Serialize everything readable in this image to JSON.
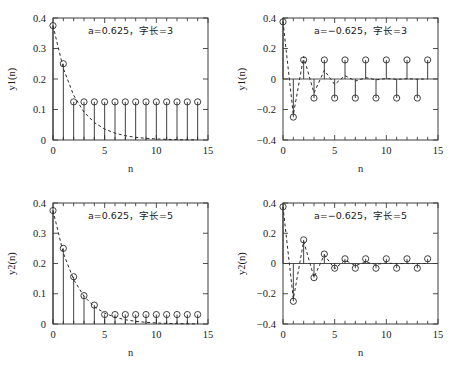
{
  "figure": {
    "width": 460,
    "height": 369,
    "background": "#ffffff",
    "ink_color": "#2a2a2a",
    "axis_color": "#3c3c3c"
  },
  "chart_data": [
    {
      "id": "top-left",
      "type": "scatter",
      "subtype": "stem",
      "title": "",
      "annotation": "a=0.625，字长=3",
      "annotation_parts": {
        "param": "a=0.625",
        "separator": "，",
        "wordlength": "字长=3"
      },
      "xlabel": "n",
      "ylabel": "y1(n)",
      "xlim": [
        0,
        15
      ],
      "ylim": [
        0,
        0.4
      ],
      "xticks": [
        0,
        5,
        10,
        15
      ],
      "xticklabels": [
        "0",
        "5",
        "10",
        "15"
      ],
      "xminor_step": 1,
      "yticks": [
        0,
        0.1,
        0.2,
        0.3,
        0.4
      ],
      "yticklabels": [
        "0",
        "0.1",
        "0.2",
        "0.3",
        "0.4"
      ],
      "grid": false,
      "legend": "none",
      "x": [
        0,
        1,
        2,
        3,
        4,
        5,
        6,
        7,
        8,
        9,
        10,
        11,
        12,
        13,
        14
      ],
      "values": [
        0.375,
        0.25,
        0.125,
        0.125,
        0.125,
        0.125,
        0.125,
        0.125,
        0.125,
        0.125,
        0.125,
        0.125,
        0.125,
        0.125,
        0.125
      ],
      "reference_curve": {
        "name": "ideal",
        "style": "dashed",
        "x": [
          0,
          1,
          2,
          3,
          4,
          5,
          6,
          7,
          8,
          9,
          10,
          11,
          12,
          13,
          14
        ],
        "values": [
          0.375,
          0.2344,
          0.1465,
          0.0916,
          0.0572,
          0.0358,
          0.0224,
          0.014,
          0.0087,
          0.0055,
          0.0034,
          0.0021,
          0.0013,
          0.0008,
          0.0005
        ]
      }
    },
    {
      "id": "top-right",
      "type": "scatter",
      "subtype": "stem",
      "title": "",
      "annotation": "a=−0.625，字长=3",
      "annotation_parts": {
        "param": "a=−0.625",
        "separator": "，",
        "wordlength": "字长=3"
      },
      "xlabel": "n",
      "ylabel": "y1(n)",
      "xlim": [
        0,
        15
      ],
      "ylim": [
        -0.4,
        0.4
      ],
      "xticks": [
        0,
        5,
        10,
        15
      ],
      "xticklabels": [
        "0",
        "5",
        "10",
        "15"
      ],
      "xminor_step": 1,
      "yticks": [
        -0.4,
        -0.2,
        0,
        0.2,
        0.4
      ],
      "yticklabels": [
        "−0.4",
        "−0.2",
        "0",
        "0.2",
        "0.4"
      ],
      "grid": false,
      "legend": "none",
      "x": [
        0,
        1,
        2,
        3,
        4,
        5,
        6,
        7,
        8,
        9,
        10,
        11,
        12,
        13,
        14
      ],
      "values": [
        0.375,
        -0.25,
        0.125,
        -0.125,
        0.125,
        -0.125,
        0.125,
        -0.125,
        0.125,
        -0.125,
        0.125,
        -0.125,
        0.125,
        -0.125,
        0.125
      ],
      "reference_curve": {
        "name": "ideal",
        "style": "dashed",
        "x": [
          0,
          1,
          2,
          3,
          4,
          5,
          6,
          7,
          8,
          9,
          10,
          11,
          12,
          13,
          14
        ],
        "values": [
          0.375,
          -0.2344,
          0.1465,
          -0.0916,
          0.0572,
          -0.0358,
          0.0224,
          -0.014,
          0.0087,
          -0.0055,
          0.0034,
          -0.0021,
          0.0013,
          -0.0008,
          0.0005
        ]
      }
    },
    {
      "id": "bottom-left",
      "type": "scatter",
      "subtype": "stem",
      "title": "",
      "annotation": "a=0.625，字长=5",
      "annotation_parts": {
        "param": "a=0.625",
        "separator": "，",
        "wordlength": "字长=5"
      },
      "xlabel": "n",
      "ylabel": "y2(n)",
      "xlim": [
        0,
        15
      ],
      "ylim": [
        0,
        0.4
      ],
      "xticks": [
        0,
        5,
        10,
        15
      ],
      "xticklabels": [
        "0",
        "5",
        "10",
        "15"
      ],
      "xminor_step": 1,
      "yticks": [
        0,
        0.1,
        0.2,
        0.3,
        0.4
      ],
      "yticklabels": [
        "0",
        "0.1",
        "0.2",
        "0.3",
        "0.4"
      ],
      "grid": false,
      "legend": "none",
      "x": [
        0,
        1,
        2,
        3,
        4,
        5,
        6,
        7,
        8,
        9,
        10,
        11,
        12,
        13,
        14
      ],
      "values": [
        0.375,
        0.25,
        0.15625,
        0.09375,
        0.0625,
        0.03125,
        0.03125,
        0.03125,
        0.03125,
        0.03125,
        0.03125,
        0.03125,
        0.03125,
        0.03125,
        0.03125
      ],
      "reference_curve": {
        "name": "ideal",
        "style": "dashed",
        "x": [
          0,
          1,
          2,
          3,
          4,
          5,
          6,
          7,
          8,
          9,
          10,
          11,
          12,
          13,
          14
        ],
        "values": [
          0.375,
          0.2344,
          0.1465,
          0.0916,
          0.0572,
          0.0358,
          0.0224,
          0.014,
          0.0087,
          0.0055,
          0.0034,
          0.0021,
          0.0013,
          0.0008,
          0.0005
        ]
      }
    },
    {
      "id": "bottom-right",
      "type": "scatter",
      "subtype": "stem",
      "title": "",
      "annotation": "a=−0.625，字长=5",
      "annotation_parts": {
        "param": "a=−0.625",
        "separator": "，",
        "wordlength": "字长=5"
      },
      "xlabel": "n",
      "ylabel": "y2(n)",
      "xlim": [
        0,
        15
      ],
      "ylim": [
        -0.4,
        0.4
      ],
      "xticks": [
        0,
        5,
        10,
        15
      ],
      "xticklabels": [
        "0",
        "5",
        "10",
        "15"
      ],
      "xminor_step": 1,
      "yticks": [
        -0.4,
        -0.2,
        0,
        0.2,
        0.4
      ],
      "yticklabels": [
        "−0.4",
        "−0.2",
        "0",
        "0.2",
        "0.4"
      ],
      "grid": false,
      "legend": "none",
      "x": [
        0,
        1,
        2,
        3,
        4,
        5,
        6,
        7,
        8,
        9,
        10,
        11,
        12,
        13,
        14
      ],
      "values": [
        0.375,
        -0.25,
        0.15625,
        -0.09375,
        0.0625,
        -0.03125,
        0.03125,
        -0.03125,
        0.03125,
        -0.03125,
        0.03125,
        -0.03125,
        0.03125,
        -0.03125,
        0.03125
      ],
      "reference_curve": {
        "name": "ideal",
        "style": "dashed",
        "x": [
          0,
          1,
          2,
          3,
          4,
          5,
          6,
          7,
          8,
          9,
          10,
          11,
          12,
          13,
          14
        ],
        "values": [
          0.375,
          -0.2344,
          0.1465,
          -0.0916,
          0.0572,
          -0.0358,
          0.0224,
          -0.014,
          0.0087,
          -0.0055,
          0.0034,
          -0.0021,
          0.0013,
          -0.0008,
          0.0005
        ]
      }
    }
  ]
}
